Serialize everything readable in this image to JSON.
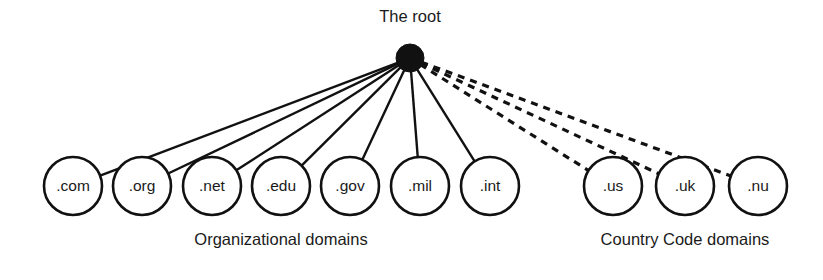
{
  "diagram": {
    "background_color": "#ffffff",
    "line_color": "#111111",
    "root": {
      "label": "The root",
      "node_style": "filled-circle",
      "cx": 410,
      "cy": 58,
      "r": 14,
      "label_x": 410,
      "label_y": 22
    },
    "groups": [
      {
        "id": "organizational",
        "label": "Organizational domains",
        "label_x": 281,
        "label_y": 245,
        "edge_style": "solid",
        "nodes": [
          {
            "label": ".com",
            "cx": 73,
            "cy": 186,
            "r": 29
          },
          {
            "label": ".org",
            "cx": 142,
            "cy": 186,
            "r": 29
          },
          {
            "label": ".net",
            "cx": 212,
            "cy": 186,
            "r": 29
          },
          {
            "label": ".edu",
            "cx": 281,
            "cy": 186,
            "r": 29
          },
          {
            "label": ".gov",
            "cx": 350,
            "cy": 186,
            "r": 29
          },
          {
            "label": ".mil",
            "cx": 420,
            "cy": 186,
            "r": 29
          },
          {
            "label": ".int",
            "cx": 490,
            "cy": 186,
            "r": 29
          }
        ]
      },
      {
        "id": "country-code",
        "label": "Country Code domains",
        "label_x": 685,
        "label_y": 245,
        "edge_style": "dashed",
        "nodes": [
          {
            "label": ".us",
            "cx": 613,
            "cy": 186,
            "r": 29
          },
          {
            "label": ".uk",
            "cx": 685,
            "cy": 186,
            "r": 29
          },
          {
            "label": ".nu",
            "cx": 758,
            "cy": 186,
            "r": 29
          }
        ]
      }
    ]
  }
}
